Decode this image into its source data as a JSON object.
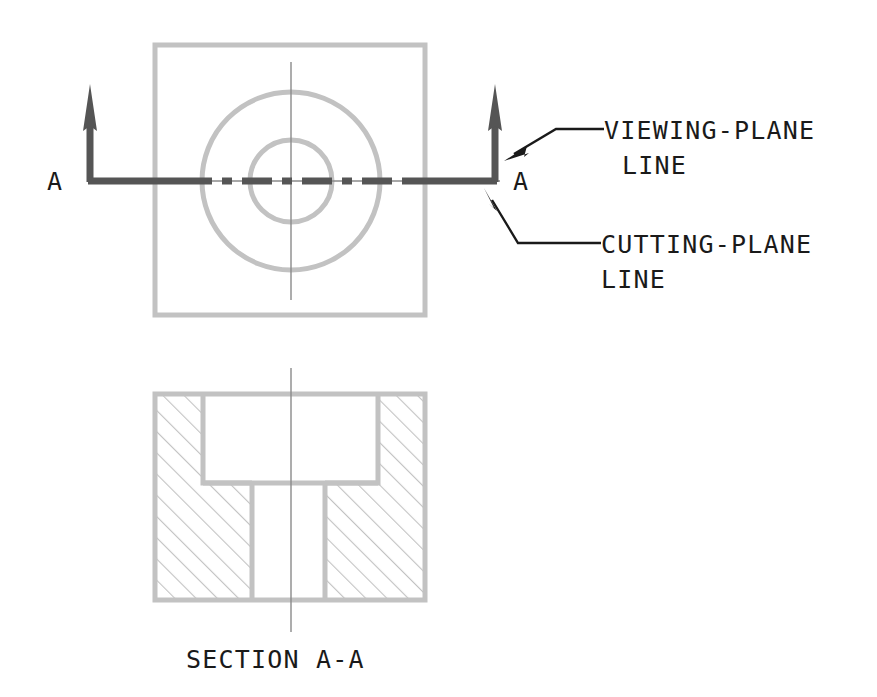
{
  "drawing": {
    "title_visible": "SECTION A-A",
    "background_color": "#ffffff",
    "object_line_color": "#c2c2c2",
    "cutting_plane_color": "#555555",
    "center_line_color": "#8a8a8a",
    "hatch_color": "#c2c2c2",
    "text_color": "#1a1a1a"
  },
  "labels": {
    "viewing_plane_line_1": "VIEWING-PLANE",
    "viewing_plane_line_2": "LINE",
    "cutting_plane_line_1": "CUTTING-PLANE",
    "cutting_plane_line_2": "LINE",
    "section_caption": "SECTION A-A",
    "arrow_label_left": "A",
    "arrow_label_right": "A"
  },
  "top_view": {
    "name": "top-view-with-cutting-plane",
    "square": {
      "x": 155,
      "y": 45,
      "width": 270,
      "height": 270
    },
    "outer_circle": {
      "cx": 291,
      "cy": 181,
      "r": 89
    },
    "inner_circle": {
      "cx": 291,
      "cy": 181,
      "r": 41
    },
    "vertical_center_line": {
      "x": 291,
      "y1": 62,
      "y2": 300
    },
    "horizontal_center_line": {
      "y": 181,
      "x1": 150,
      "x2": 500
    },
    "cutting_plane_path": "M 90 181 L 90 104 ; M 90 181 L 495 181 ; M 495 181 L 495 104",
    "arrow_left": {
      "x": 90,
      "tip_y": 84,
      "base_y": 130
    },
    "arrow_right": {
      "x": 495,
      "tip_y": 84,
      "base_y": 130
    }
  },
  "section_view": {
    "name": "section-view-a-a",
    "outer_rect": {
      "x": 155,
      "y": 394,
      "width": 270,
      "height": 206
    },
    "counterbore": {
      "x": 203,
      "y": 394,
      "width": 175,
      "height": 89
    },
    "through_hole": {
      "x": 252,
      "y": 483,
      "width": 73,
      "height": 117
    },
    "vertical_center_line": {
      "x": 291,
      "y1": 368,
      "y2": 632
    },
    "hatch_angle_deg": 45,
    "hatch_spacing_px": 15
  },
  "leaders": {
    "viewing_plane": {
      "arrow_tip": {
        "x": 511,
        "y": 156
      },
      "bend": {
        "x": 556,
        "y": 129
      },
      "end": {
        "x": 604,
        "y": 129
      }
    },
    "cutting_plane": {
      "arrow_tip": {
        "x": 489,
        "y": 199
      },
      "bend": {
        "x": 518,
        "y": 243
      },
      "end": {
        "x": 601,
        "y": 243
      }
    }
  },
  "text_positions": {
    "viewing_plane_line_1": {
      "x": 604,
      "y": 139
    },
    "viewing_plane_line_2": {
      "x": 622,
      "y": 174
    },
    "cutting_plane_line_1": {
      "x": 601,
      "y": 253
    },
    "cutting_plane_line_2": {
      "x": 601,
      "y": 288
    },
    "section_caption": {
      "x": 186,
      "y": 668
    },
    "arrow_label_left": {
      "x": 47,
      "y": 190
    },
    "arrow_label_right": {
      "x": 513,
      "y": 190
    }
  }
}
